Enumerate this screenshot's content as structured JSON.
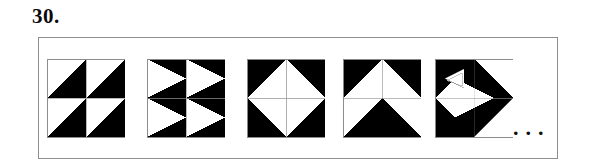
{
  "question": {
    "number_label": "30.",
    "continuation_label": "...",
    "type": "visual-sequence-pattern"
  },
  "frame": {
    "border_color": "#8e8e8e",
    "background_color": "#ffffff"
  },
  "palette": {
    "ink": "#000000",
    "paper": "#ffffff",
    "grid_line": "#9a9a9a",
    "text": "#0a0a0a"
  },
  "sequence": {
    "count": 5,
    "tiles": [
      {
        "index": 1,
        "name": "pinwheel-four-diagonals",
        "description": "Square divided into four quadrants; each quadrant split by a diagonal from its bottom-left to top-right, with the lower-right half filled black.",
        "fill_fraction": "1/2"
      },
      {
        "index": 2,
        "name": "four-right-pointing-white-triangles",
        "description": "Square divided into four quadrants on a black ground; each quadrant holds a white triangle pointing right toward the quadrant's mid-right vertex.",
        "fill_fraction": "1/2"
      },
      {
        "index": 3,
        "name": "white-diamond-on-black",
        "description": "Square with a white diamond (rhombus) joining the midpoints of the four sides; corners are black; thin grid lines cross the centre.",
        "fill_fraction": "1/2"
      },
      {
        "index": 4,
        "name": "double-chevron-arrows-up",
        "description": "Top half black with a white triangle pointing up; bottom half white with a black triangle pointing up.",
        "fill_fraction": "1/2"
      },
      {
        "index": 5,
        "name": "rotated-arrow-cluster",
        "description": "Square with a large black arrow head pointing right, a smaller white arrow nested inside, and black wedges in the upper-left and lower-left corners.",
        "fill_fraction": "1/2"
      }
    ]
  }
}
